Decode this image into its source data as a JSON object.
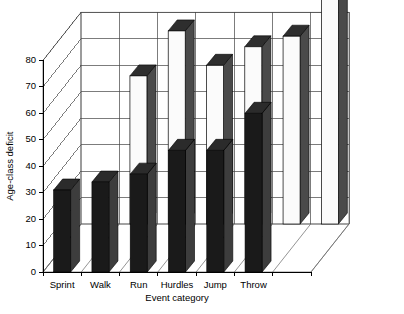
{
  "chart_data": {
    "type": "bar",
    "title": "",
    "subtitle": "",
    "xlabel": "Event category",
    "ylabel": "Age-class deficit",
    "ylim": [
      0,
      80
    ],
    "yticks": [
      0,
      10,
      20,
      30,
      40,
      50,
      60,
      70,
      80
    ],
    "ytick_labels": [
      "0",
      "10",
      "20",
      "30",
      "40",
      "50",
      "60",
      "70",
      "80"
    ],
    "grid": true,
    "legend": "none",
    "projection": "3d",
    "categories": [
      "Sprint",
      "Walk",
      "Run",
      "Hurdles",
      "Jump",
      "Throw",
      ""
    ],
    "series": [
      {
        "name": "front-row",
        "style": "dark",
        "values": [
          31,
          34,
          37,
          46,
          46,
          60,
          null
        ]
      },
      {
        "name": "back-row",
        "style": "light",
        "values": [
          null,
          56,
          73,
          60,
          67,
          71,
          92
        ]
      }
    ]
  },
  "axes": {
    "y_title": "Age-class deficit",
    "x_title": "Event category"
  },
  "colors": {
    "dark_bar_face": "#1a1a1a",
    "dark_bar_side": "#3d3d3d",
    "light_bar_face": "#fbfbfb",
    "light_bar_side": "#4a4a4a",
    "grid": "#444444",
    "axis": "#000000",
    "background": "#ffffff"
  }
}
